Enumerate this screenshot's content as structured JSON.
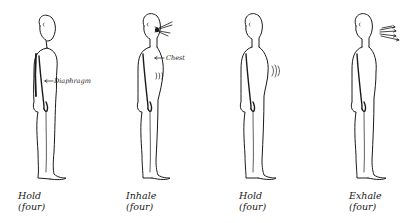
{
  "panels": [
    {
      "phase": "Hold",
      "count": "(four)",
      "annotation": "Diaphragm",
      "state": "rest"
    },
    {
      "phase": "Inhale",
      "count": "(four)",
      "annotation": "Chest",
      "state": "inhale"
    },
    {
      "phase": "Hold",
      "count": "(four)",
      "annotation": "",
      "state": "hold"
    },
    {
      "phase": "Exhale",
      "count": "(four)",
      "annotation": "",
      "state": "exhale"
    }
  ],
  "colors": {
    "ink": "#1a1a1a",
    "background": "#ffffff"
  }
}
